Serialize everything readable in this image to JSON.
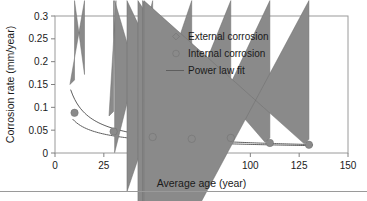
{
  "chart_data": {
    "type": "scatter",
    "title": "",
    "xlabel": "Average age (year)",
    "ylabel": "Corrosion rate (mm/year)",
    "xlim": [
      0,
      150
    ],
    "ylim": [
      0,
      0.3
    ],
    "grid": false,
    "legend_position": "upper-center",
    "xticks": [
      "0",
      "25",
      "50",
      "75",
      "100",
      "125",
      "150"
    ],
    "xtick_values": [
      0,
      25,
      50,
      75,
      100,
      125,
      150
    ],
    "yticks": [
      "0",
      "0.05",
      "0.1",
      "0.15",
      "0.2",
      "0.25",
      "0.3"
    ],
    "ytick_values": [
      0,
      0.05,
      0.1,
      0.15,
      0.2,
      0.25,
      0.3
    ],
    "x": [
      10,
      30,
      50,
      70,
      90,
      110,
      130
    ],
    "series": [
      {
        "name": "External corrosion",
        "marker": "diamond",
        "color": "#8a8a8a",
        "values": [
          0.15,
          0.081,
          0.084,
          0.057,
          0.033,
          0.023,
          0.02
        ]
      },
      {
        "name": "Internal corrosion",
        "marker": "circle",
        "color": "#8a8a8a",
        "values": [
          0.088,
          0.047,
          0.035,
          0.031,
          0.033,
          0.022,
          0.018
        ]
      }
    ],
    "fits": [
      {
        "name": "Power law fit (external)",
        "coefficient": 0.62,
        "exponent": -0.72,
        "x_start": 8,
        "x_end": 132
      },
      {
        "name": "Power law fit (internal)",
        "coefficient": 0.26,
        "exponent": -0.57,
        "x_start": 9,
        "x_end": 132
      }
    ],
    "legend": [
      {
        "label": "External corrosion",
        "marker": "diamond"
      },
      {
        "label": "Internal corrosion",
        "marker": "circle"
      },
      {
        "label": "Power law fit",
        "marker": "line"
      }
    ]
  }
}
